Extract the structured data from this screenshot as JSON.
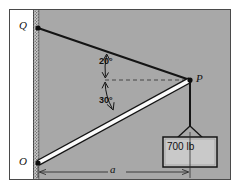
{
  "figure": {
    "type": "statics-free-body-diagram",
    "background_color": "#a8a8a8",
    "frame_border_color": "#4a4a4a",
    "wall": {
      "fill_color": "#ffffff",
      "hatch_color": "#6b6b6b",
      "description": "vertical wall at left with hatched inner edge"
    },
    "points": [
      {
        "id": "Q",
        "label": "Q",
        "x": 38,
        "y": 28
      },
      {
        "id": "O",
        "label": "O",
        "x": 38,
        "y": 163
      },
      {
        "id": "P",
        "label": "P",
        "x": 190,
        "y": 80
      }
    ],
    "members": [
      {
        "id": "cable-QP",
        "from": "Q",
        "to": "P",
        "style": "solid-black-line",
        "color": "#141414"
      },
      {
        "id": "boom-OP",
        "from": "O",
        "to": "P",
        "style": "white-bar-with-black-outline",
        "fill": "#ffffff",
        "outline": "#141414"
      },
      {
        "id": "cable-P-load",
        "from": "P",
        "to": "sling",
        "style": "solid-black-line",
        "color": "#141414"
      }
    ],
    "reference_line": {
      "id": "horizontal-dashed",
      "style": "dashed",
      "color": "#3a3a3a",
      "from_x": 105,
      "to_x": 188,
      "y": 80
    },
    "angles": [
      {
        "id": "angle-QP-horizontal",
        "value": "20°",
        "between": [
          "cable-QP",
          "horizontal-dashed"
        ]
      },
      {
        "id": "angle-OP-horizontal",
        "value": "30°",
        "between": [
          "boom-OP",
          "horizontal-dashed"
        ]
      }
    ],
    "dimension": {
      "id": "dimension-a",
      "label": "a",
      "from_x": 38,
      "to_x": 190,
      "y": 172,
      "style": "double-arrow",
      "color": "#2f2f2f"
    },
    "load": {
      "id": "suspended-weight",
      "text": "700 lb",
      "box_fill": "#c9c9c9",
      "box_border": "#141414",
      "sling": "v-shaped-two-leg"
    }
  },
  "labels": {
    "point_q": "Q",
    "point_o": "O",
    "point_p": "P",
    "dimension_a": "a",
    "angle_top": "20°",
    "angle_bottom": "30°",
    "load_text": "700 lb"
  }
}
